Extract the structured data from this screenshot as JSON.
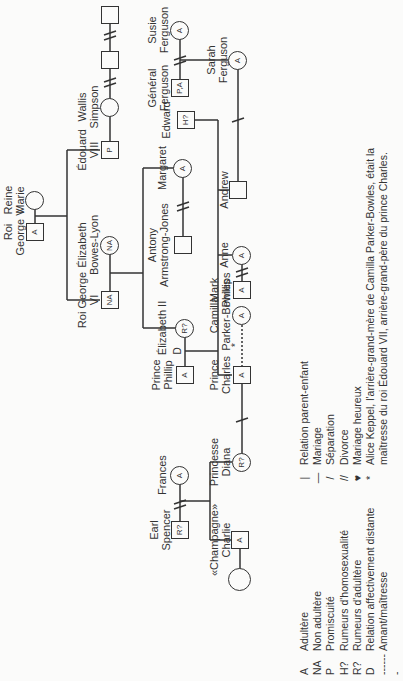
{
  "people": {
    "george_v": {
      "name_line1": "Roi",
      "name_line2": "George V",
      "mark": "A"
    },
    "reine_marie": {
      "name_line1": "Reine",
      "name_line2": "Marie",
      "mark": ""
    },
    "edouard_viii": {
      "name_line1": "Édouard",
      "name_line2": "VIII",
      "mark": "P"
    },
    "wallis": {
      "name_line1": "Wallis",
      "name_line2": "Simpson",
      "mark": ""
    },
    "wallis_husband1": {
      "mark": ""
    },
    "wallis_husband2": {
      "mark": ""
    },
    "george_vi": {
      "name_line1": "Roi George",
      "name_line2": "VI",
      "mark": "NA"
    },
    "bowes_lyon": {
      "name_line1": "Élizabeth",
      "name_line2": "Bowes-Lyon",
      "mark": "NA"
    },
    "margaret": {
      "name_line1": "Margaret",
      "mark": "A"
    },
    "armstrong_jones": {
      "name_line1": "Antony",
      "name_line2": "Armstrong-Jones",
      "mark": ""
    },
    "elizabeth_ii": {
      "name_line1": "Élizabeth II",
      "mark": "R?"
    },
    "phillip": {
      "name_line1": "Prince",
      "name_line2": "Phillip",
      "mark": "A"
    },
    "phillip_elizabeth_rel": "D",
    "charles": {
      "name_line1": "Prince",
      "name_line2": "Charles",
      "mark": "A"
    },
    "camilla": {
      "name_line1": "Camilla",
      "name_line2": "Parker-Bowles",
      "mark": "A"
    },
    "camilla_rel": "*",
    "anne": {
      "name_line1": "Anne",
      "mark": "A"
    },
    "mark_phillips": {
      "name_line1": "Mark",
      "name_line2": "Phillips",
      "mark": "A"
    },
    "andrew": {
      "name_line1": "Andrew",
      "mark": ""
    },
    "edward": {
      "name_line1": "Edward",
      "mark": "H?"
    },
    "sarah": {
      "name_line1": "Sarah",
      "name_line2": "Ferguson",
      "mark": "A"
    },
    "general_ferguson": {
      "name_line1": "Général",
      "name_line2": "Ferguson",
      "mark": "P,A"
    },
    "susie": {
      "name_line1": "Susie",
      "name_line2": "Ferguson",
      "mark": "A"
    },
    "diana": {
      "name_line1": "Princesse",
      "name_line2": "Diana",
      "mark": "R?"
    },
    "earl_spencer": {
      "name_line1": "Earl",
      "name_line2": "Spencer",
      "mark": "R?"
    },
    "frances": {
      "name_line1": "Frances",
      "mark": "A"
    },
    "champagne_charlie": {
      "name_line1": "«Champagne»",
      "name_line2": "Charlie",
      "mark": "A"
    },
    "charlie_partner": {
      "mark": ""
    }
  },
  "legend_left": [
    {
      "code": "A",
      "text": "Adultère"
    },
    {
      "code": "NA",
      "text": "Non adultère"
    },
    {
      "code": "P",
      "text": "Promiscuité"
    },
    {
      "code": "H?",
      "text": "Rumeurs d'homosexualité"
    },
    {
      "code": "R?",
      "text": "Rumeurs d'adultère"
    },
    {
      "code": "D",
      "text": "Relation affectivement distante"
    },
    {
      "code": "-------",
      "text": "Amant/maîtresse"
    }
  ],
  "legend_right": [
    {
      "sym": "|",
      "text": "Relation parent-enfant"
    },
    {
      "sym": "—",
      "text": "Mariage"
    },
    {
      "sym": "/",
      "text": "Séparation"
    },
    {
      "sym": "//",
      "text": "Divorce"
    },
    {
      "sym": "♥",
      "text": "Mariage heureux"
    },
    {
      "sym": "*",
      "text": "Alice Keppel, l'arrière-grand-mère de Camilla Parker-Bowles, était la"
    },
    {
      "sym": "",
      "text": "maîtresse du roi Édouard VII, arrière-grand-père du prince Charles."
    }
  ]
}
